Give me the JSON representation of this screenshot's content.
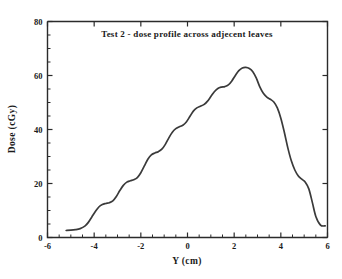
{
  "chart_data": {
    "type": "line",
    "title": "Test 2 - dose profile across adjecent leaves",
    "xlabel": "Y (cm)",
    "ylabel": "Dose  (cGy)",
    "xlim": [
      -6,
      6
    ],
    "ylim": [
      0,
      80
    ],
    "grid": false,
    "legend": null,
    "xticks": [
      -6,
      -4,
      -2,
      0,
      2,
      4,
      6
    ],
    "xtick_labels": [
      "-6",
      "-4",
      "-2",
      "0",
      "2",
      "4",
      "6"
    ],
    "yticks": [
      0,
      20,
      40,
      60,
      80
    ],
    "ytick_labels": [
      "0",
      "20",
      "40",
      "60",
      "80"
    ],
    "x_minor_tick_step": 0.5,
    "y_minor_tick_step": 5,
    "series": [
      {
        "name": "dose profile",
        "color": "#3a3a3a",
        "x": [
          -5.2,
          -5.0,
          -4.8,
          -4.6,
          -4.4,
          -4.25,
          -4.1,
          -3.95,
          -3.8,
          -3.65,
          -3.5,
          -3.35,
          -3.2,
          -3.05,
          -2.9,
          -2.75,
          -2.6,
          -2.45,
          -2.3,
          -2.15,
          -2.0,
          -1.85,
          -1.7,
          -1.55,
          -1.4,
          -1.25,
          -1.1,
          -0.95,
          -0.8,
          -0.65,
          -0.5,
          -0.35,
          -0.2,
          -0.05,
          0.1,
          0.25,
          0.4,
          0.55,
          0.7,
          0.85,
          1.0,
          1.15,
          1.3,
          1.45,
          1.6,
          1.75,
          1.9,
          2.05,
          2.2,
          2.35,
          2.5,
          2.65,
          2.8,
          2.95,
          3.1,
          3.25,
          3.4,
          3.55,
          3.7,
          3.85,
          4.0,
          4.15,
          4.3,
          4.45,
          4.6,
          4.75,
          4.9,
          5.05,
          5.2,
          5.35,
          5.5,
          5.7,
          5.9
        ],
        "y": [
          2.6,
          2.7,
          2.9,
          3.3,
          4.2,
          5.6,
          7.6,
          9.6,
          11.3,
          12.2,
          12.6,
          12.9,
          13.6,
          15.2,
          17.4,
          19.3,
          20.5,
          21.0,
          21.4,
          22.2,
          24.0,
          26.5,
          29.0,
          30.6,
          31.3,
          31.8,
          32.7,
          34.5,
          36.9,
          39.0,
          40.3,
          41.0,
          41.6,
          42.8,
          44.8,
          46.8,
          48.0,
          48.6,
          49.2,
          50.4,
          52.2,
          54.0,
          55.2,
          55.7,
          55.9,
          56.5,
          58.0,
          60.0,
          61.8,
          62.8,
          63.0,
          62.6,
          61.4,
          59.0,
          55.8,
          53.4,
          52.0,
          51.2,
          50.2,
          48.0,
          44.2,
          39.0,
          33.2,
          28.4,
          25.0,
          22.8,
          21.6,
          20.5,
          18.0,
          13.0,
          7.8,
          4.6,
          4.3
        ],
        "peak_value": 63.0,
        "peak_x": 2.5,
        "min_value": 2.6
      }
    ]
  },
  "figure": {
    "background_color": "#ffffff",
    "axis_color": "#2b2b2b",
    "line_color": "#3a3a3a"
  }
}
